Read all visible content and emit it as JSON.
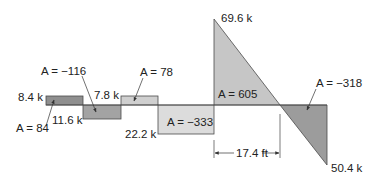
{
  "diagram": {
    "type": "shear-force-diagram",
    "colors": {
      "dark_fill": "#8f8f8f",
      "medium_fill": "#a9a9a9",
      "light_fill": "#cfcfcf",
      "lighter_fill": "#dcdcdc",
      "stroke": "#4a4a4a",
      "text": "#222222"
    },
    "segments": [
      {
        "shape": "rectangle",
        "value_label": "8.4 k",
        "area_label": "A = 84",
        "sign": "positive"
      },
      {
        "shape": "rectangle",
        "value_label": "11.6 k",
        "area_label": "A = −116",
        "sign": "negative"
      },
      {
        "shape": "rectangle",
        "value_label": "7.8 k",
        "area_label": "A = 78",
        "sign": "positive"
      },
      {
        "shape": "rectangle",
        "value_label": "22.2 k",
        "area_label": "A = −333",
        "sign": "negative"
      },
      {
        "shape": "triangle",
        "value_label": "69.6 k",
        "area_label": "A = 605",
        "sign": "positive"
      },
      {
        "shape": "triangle",
        "value_label": "50.4 k",
        "area_label": "A = −318",
        "sign": "negative"
      }
    ],
    "dimension": {
      "label": "17.4 ft"
    }
  }
}
